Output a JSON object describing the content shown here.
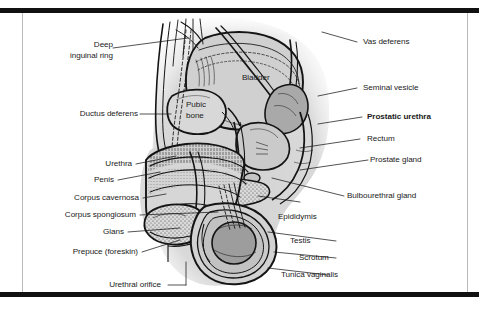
{
  "figure": {
    "border_color": "#111111",
    "frame_color": "#b9b9b9",
    "background": "#ffffff",
    "body_tint": "#d7d7d7",
    "ink": "#1a1a1a"
  },
  "labels_left": [
    {
      "id": "deep-inguinal-ring",
      "line1": "Deep",
      "line2": "inguinal ring",
      "text": "Deep inguinal ring",
      "bold": false
    },
    {
      "id": "ductus-deferens",
      "text": "Ductus deferens",
      "bold": false
    },
    {
      "id": "urethra",
      "text": "Urethra",
      "bold": false
    },
    {
      "id": "penis",
      "text": "Penis",
      "bold": false
    },
    {
      "id": "corpus-cavernosa",
      "text": "Corpus cavernosa",
      "bold": false
    },
    {
      "id": "corpus-spongiosum",
      "text": "Corpus spongiosum",
      "bold": false
    },
    {
      "id": "glans",
      "text": "Glans",
      "bold": false
    },
    {
      "id": "prepuce",
      "text": "Prepuce (foreskin)",
      "bold": false
    },
    {
      "id": "urethral-orifice",
      "text": "Urethral orifice",
      "bold": false
    }
  ],
  "labels_right": [
    {
      "id": "vas-deferens",
      "text": "Vas deferens",
      "bold": false
    },
    {
      "id": "seminal-vesicle",
      "text": "Seminal vesicle",
      "bold": false
    },
    {
      "id": "prostatic-urethra",
      "text": "Prostatic urethra",
      "bold": true
    },
    {
      "id": "rectum",
      "text": "Rectum",
      "bold": false
    },
    {
      "id": "prostate-gland",
      "text": "Prostate gland",
      "bold": false
    },
    {
      "id": "bulbourethral-gland",
      "text": "Bulbourethral gland",
      "bold": false
    },
    {
      "id": "epididymis",
      "text": "Epididymis",
      "bold": false
    },
    {
      "id": "testis",
      "text": "Testis",
      "bold": false
    },
    {
      "id": "scrotum",
      "text": "Scrotum",
      "bold": false
    },
    {
      "id": "tunica-vaginalis",
      "text": "Tunica vaginalis",
      "bold": false
    }
  ],
  "labels_inner": [
    {
      "id": "bladder",
      "text": "Bladder",
      "bold": false
    },
    {
      "id": "pubic-bone",
      "line1": "Pubic",
      "line2": "bone",
      "text": "Pubic bone",
      "bold": false
    }
  ]
}
